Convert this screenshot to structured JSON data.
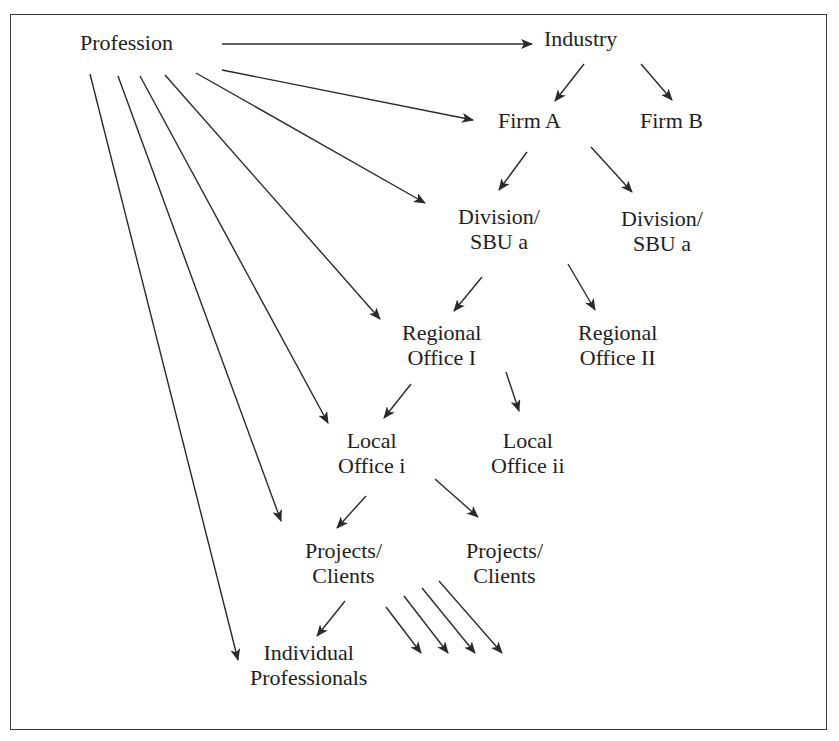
{
  "caption_fragment": "Figure: Levels of professional identity",
  "nodes": {
    "profession": {
      "lines": [
        "Profession"
      ]
    },
    "industry": {
      "lines": [
        "Industry"
      ]
    },
    "firm_a": {
      "lines": [
        "Firm A"
      ]
    },
    "firm_b": {
      "lines": [
        "Firm B"
      ]
    },
    "division_left": {
      "lines": [
        "Division/",
        "SBU a"
      ]
    },
    "division_right": {
      "lines": [
        "Division/",
        "SBU a"
      ]
    },
    "regional_1": {
      "lines": [
        "Regional",
        "Office I"
      ]
    },
    "regional_2": {
      "lines": [
        "Regional",
        "Office II"
      ]
    },
    "local_i": {
      "lines": [
        "Local",
        "Office i"
      ]
    },
    "local_ii": {
      "lines": [
        "Local",
        "Office ii"
      ]
    },
    "projects_left": {
      "lines": [
        "Projects/",
        "Clients"
      ]
    },
    "projects_right": {
      "lines": [
        "Projects/",
        "Clients"
      ]
    },
    "individual": {
      "lines": [
        "Individual",
        "Professionals"
      ]
    }
  },
  "edges": [
    {
      "from": "profession",
      "to": "industry"
    },
    {
      "from": "profession",
      "to": "firm_a"
    },
    {
      "from": "profession",
      "to": "division_left"
    },
    {
      "from": "profession",
      "to": "regional_1"
    },
    {
      "from": "profession",
      "to": "local_i"
    },
    {
      "from": "profession",
      "to": "projects_left"
    },
    {
      "from": "profession",
      "to": "individual"
    },
    {
      "from": "industry",
      "to": "firm_a"
    },
    {
      "from": "industry",
      "to": "firm_b"
    },
    {
      "from": "firm_a",
      "to": "division_left"
    },
    {
      "from": "firm_a",
      "to": "division_right"
    },
    {
      "from": "division_left",
      "to": "regional_1"
    },
    {
      "from": "division_left",
      "to": "regional_2"
    },
    {
      "from": "regional_1",
      "to": "local_i"
    },
    {
      "from": "regional_1",
      "to": "local_ii"
    },
    {
      "from": "local_i",
      "to": "projects_left"
    },
    {
      "from": "local_i",
      "to": "projects_right"
    },
    {
      "from": "projects_left",
      "to": "individual"
    },
    {
      "from": "projects_left",
      "to": "unlabeled-1"
    },
    {
      "from": "projects_left",
      "to": "unlabeled-2"
    },
    {
      "from": "projects_left",
      "to": "unlabeled-3"
    },
    {
      "from": "projects_left",
      "to": "unlabeled-4"
    }
  ],
  "colors": {
    "line": "#2a2a2a",
    "text": "#1e1e1e",
    "frame": "#3a3a3a",
    "background": "#ffffff"
  }
}
